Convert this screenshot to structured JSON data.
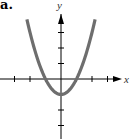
{
  "panel_label": "a.",
  "chart_data": {
    "type": "line",
    "title": "",
    "function": "y = x^2 - 1",
    "xlabel": "x",
    "ylabel": "y",
    "xlim": [
      -3.5,
      4.2
    ],
    "ylim": [
      -2.8,
      4.8
    ],
    "x_ticks": [
      -3,
      -2,
      -1,
      1,
      2,
      3
    ],
    "y_ticks": [
      -3,
      -2,
      -1,
      1,
      2,
      3
    ],
    "tick_labels_shown": false,
    "grid": false,
    "series": [
      {
        "name": "parabola",
        "color": "#6e6e6e",
        "x": [
          -2.2,
          -2,
          -1.5,
          -1,
          -0.5,
          0,
          0.5,
          1,
          1.5,
          2,
          2.2
        ],
        "y": [
          3.84,
          3,
          1.25,
          0,
          -0.75,
          -1,
          -0.75,
          0,
          1.25,
          3,
          3.84
        ]
      }
    ],
    "vertex": [
      0,
      -1
    ],
    "x_intercepts": [
      -1,
      1
    ]
  },
  "colors": {
    "axis": "#000000",
    "curve": "#6e6e6e",
    "background": "#ffffff"
  }
}
